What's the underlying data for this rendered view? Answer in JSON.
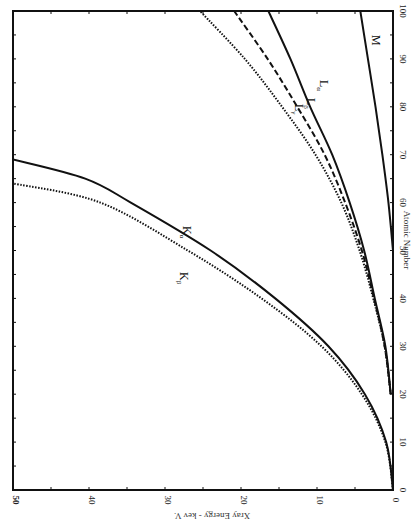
{
  "chart_data": {
    "type": "line",
    "orientation": "rotated 90° clockwise (x-axis runs vertically on right, y-axis horizontally at bottom, both reversed)",
    "title": "",
    "xlabel": "Atomic Number",
    "ylabel": "Xray Energy - kev V.",
    "xlim": [
      0,
      100
    ],
    "ylim": [
      0,
      50
    ],
    "x_ticks": [
      0,
      10,
      20,
      30,
      40,
      50,
      60,
      70,
      80,
      90,
      100
    ],
    "y_ticks": [
      0,
      10,
      20,
      30,
      40,
      50
    ],
    "grid": false,
    "legend": "inline labels",
    "series": [
      {
        "name": "Kα",
        "style": "solid",
        "x": [
          0,
          10,
          20,
          30,
          40,
          50,
          60,
          65,
          69
        ],
        "y": [
          0,
          0.9,
          3.7,
          8.5,
          15.5,
          24.0,
          34.5,
          40.5,
          50.0
        ]
      },
      {
        "name": "Kβ",
        "style": "dotted",
        "x": [
          0,
          10,
          20,
          30,
          40,
          50,
          60,
          64
        ],
        "y": [
          0,
          1.0,
          4.1,
          9.4,
          17.3,
          27.0,
          38.5,
          50.0
        ]
      },
      {
        "name": "Lα",
        "style": "solid",
        "x": [
          20,
          30,
          40,
          50,
          60,
          70,
          80,
          90,
          100
        ],
        "y": [
          0.3,
          1.0,
          2.4,
          3.8,
          5.7,
          8.0,
          10.9,
          13.5,
          16.4
        ]
      },
      {
        "name": "Lβ",
        "style": "dashed",
        "x": [
          20,
          30,
          40,
          50,
          60,
          70,
          80,
          90,
          100
        ],
        "y": [
          0.3,
          1.1,
          2.5,
          4.1,
          6.3,
          9.0,
          12.6,
          16.5,
          20.9
        ]
      },
      {
        "name": "Lγ",
        "style": "dotted",
        "x": [
          20,
          30,
          40,
          50,
          60,
          70,
          80,
          90,
          100
        ],
        "y": [
          0.3,
          1.1,
          2.6,
          4.4,
          6.8,
          10.2,
          14.6,
          19.5,
          25.4
        ]
      },
      {
        "name": "M",
        "style": "solid",
        "x": [
          50,
          60,
          70,
          80,
          90,
          100
        ],
        "y": [
          0.0,
          0.6,
          1.4,
          2.3,
          3.3,
          4.3
        ]
      }
    ],
    "labels": {
      "Ka": {
        "main": "K",
        "sub": "α"
      },
      "Kb": {
        "main": "K",
        "sub": "β"
      },
      "La": {
        "main": "L",
        "sub": "α"
      },
      "Lb": {
        "main": "L",
        "sub": "β"
      },
      "Lg": {
        "main": "L",
        "sub": "γ"
      },
      "M": {
        "main": "M",
        "sub": ""
      }
    },
    "tick_labels": {
      "x": [
        "0",
        "10",
        "20",
        "30",
        "40",
        "50",
        "60",
        "70",
        "80",
        "90",
        "100"
      ],
      "y": [
        "0",
        "10",
        "20",
        "30",
        "40",
        "50"
      ]
    }
  }
}
